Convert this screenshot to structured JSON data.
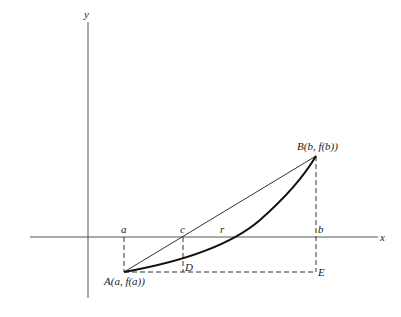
{
  "labels": {
    "y_axis": "y",
    "x_axis": "x",
    "a": "a",
    "c": "c",
    "r": "r",
    "b": "b",
    "D": "D",
    "E": "E",
    "A": "A(a, f(a))",
    "B": "B(b, f(b))"
  }
}
